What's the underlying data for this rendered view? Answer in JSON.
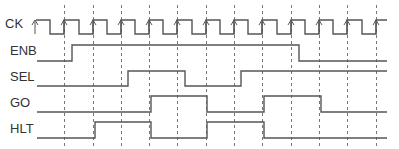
{
  "diagram": {
    "type": "timing-diagram",
    "signals": [
      {
        "name": "CK",
        "label": "CK",
        "kind": "clock"
      },
      {
        "name": "ENB",
        "label": "ENB"
      },
      {
        "name": "SEL",
        "label": "SEL"
      },
      {
        "name": "GO",
        "label": "GO"
      },
      {
        "name": "HLT",
        "label": "HLT"
      }
    ],
    "clock_rising_edges_px": [
      35,
      64,
      93,
      121,
      149,
      177,
      206,
      234,
      262,
      291,
      319,
      347,
      376
    ],
    "gridlines_px": [
      64,
      93,
      121,
      149,
      177,
      206,
      234,
      262,
      291,
      319,
      347,
      376
    ],
    "transitions": {
      "ENB": [
        {
          "x": 72,
          "to": "high"
        },
        {
          "x": 299,
          "to": "low"
        }
      ],
      "SEL": [
        {
          "x": 128,
          "to": "high"
        },
        {
          "x": 185,
          "to": "low"
        },
        {
          "x": 241,
          "to": "high"
        }
      ],
      "GO": [
        {
          "x": 151,
          "to": "high"
        },
        {
          "x": 207,
          "to": "low"
        },
        {
          "x": 264,
          "to": "high"
        },
        {
          "x": 321,
          "to": "low"
        }
      ],
      "HLT": [
        {
          "x": 95,
          "to": "high"
        },
        {
          "x": 151,
          "to": "low"
        },
        {
          "x": 207,
          "to": "high"
        },
        {
          "x": 264,
          "to": "low"
        }
      ]
    },
    "colors": {
      "line": "#555555",
      "grid": "#777777",
      "text": "#333333"
    }
  }
}
